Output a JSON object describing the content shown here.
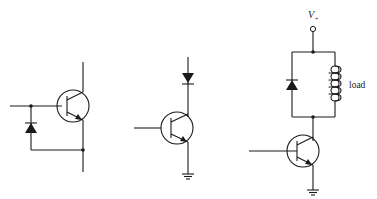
{
  "diagram": {
    "type": "circuit-schematic",
    "circuits": [
      {
        "id": "circuit-1",
        "description": "NPN transistor with diode between base and emitter (reverse-protection)",
        "components": [
          "npn-transistor",
          "diode",
          "junction-dots"
        ]
      },
      {
        "id": "circuit-2",
        "description": "NPN transistor with series diode on collector, emitter grounded",
        "components": [
          "npn-transistor",
          "diode",
          "ground"
        ]
      },
      {
        "id": "circuit-3",
        "description": "NPN transistor driving inductive load with flyback diode, supply V+",
        "components": [
          "supply-terminal",
          "diode",
          "inductor",
          "npn-transistor",
          "ground"
        ],
        "supply_label": "V",
        "supply_subscript": "+",
        "load_label": "load"
      }
    ]
  }
}
